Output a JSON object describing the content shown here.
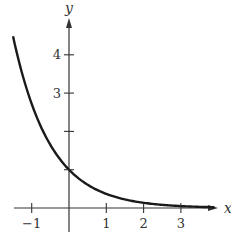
{
  "chart_data": {
    "type": "line",
    "title": "",
    "function": "y = e^(-x)",
    "xlabel": "x",
    "ylabel": "y",
    "xlim": [
      -1.5,
      3.9
    ],
    "ylim": [
      0,
      4.9
    ],
    "x_ticks": [
      -1,
      1,
      2,
      3
    ],
    "x_tick_labels": [
      "−1",
      "1",
      "2",
      "3"
    ],
    "y_ticks": [
      1,
      2,
      3,
      4
    ],
    "y_tick_labels": [
      "",
      "",
      "3",
      "4"
    ],
    "grid": false,
    "legend": null,
    "series": [
      {
        "name": "exponential decay",
        "x": [
          -1.5,
          -1.25,
          -1.0,
          -0.75,
          -0.5,
          -0.25,
          0,
          0.25,
          0.5,
          0.75,
          1.0,
          1.5,
          2.0,
          2.5,
          3.0,
          3.5
        ],
        "values": [
          4.48,
          3.49,
          2.72,
          2.12,
          1.65,
          1.28,
          1.0,
          0.78,
          0.61,
          0.47,
          0.37,
          0.22,
          0.14,
          0.08,
          0.05,
          0.03
        ]
      }
    ],
    "colors": {
      "curve": "#1a1a1a",
      "axes": "#333333"
    }
  }
}
